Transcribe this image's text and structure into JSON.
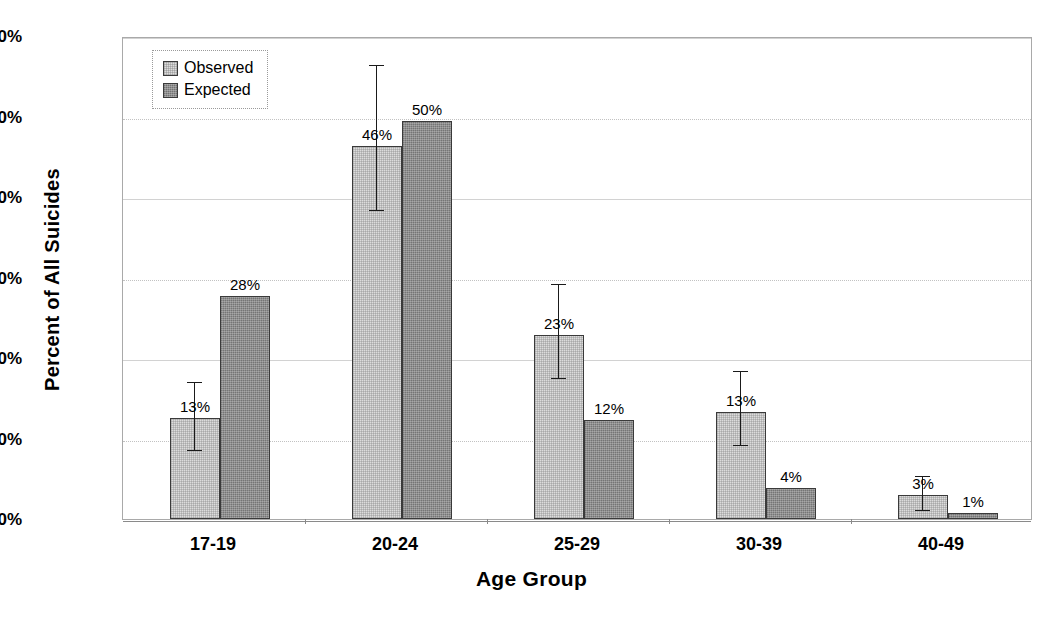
{
  "chart_data": {
    "type": "bar",
    "title": "",
    "xlabel": "Age Group",
    "ylabel": "Percent of All Suicides",
    "categories": [
      "17-19",
      "20-24",
      "25-29",
      "30-39",
      "40-49"
    ],
    "ylim": [
      0,
      60
    ],
    "ytick_labels": [
      "0%",
      "10%",
      "20%",
      "30%",
      "40%",
      "50%",
      "60%"
    ],
    "ytick_values": [
      0,
      10,
      20,
      30,
      40,
      50,
      60
    ],
    "grid": true,
    "legend_position": "top-left",
    "series": [
      {
        "name": "Observed",
        "color": "#dcdcdc",
        "values": [
          12.6,
          46.3,
          22.9,
          13.3,
          3.0
        ],
        "data_labels": [
          "13%",
          "46%",
          "23%",
          "13%",
          "3%"
        ],
        "error_bars": [
          {
            "low": 8.7,
            "high": 17.3
          },
          {
            "low": 38.5,
            "high": 56.6
          },
          {
            "low": 17.6,
            "high": 29.4
          },
          {
            "low": 9.3,
            "high": 18.6
          },
          {
            "low": 1.2,
            "high": 5.6
          }
        ]
      },
      {
        "name": "Expected",
        "color": "#8e8e8e",
        "values": [
          27.7,
          49.4,
          12.3,
          3.8,
          0.7
        ],
        "data_labels": [
          "28%",
          "50%",
          "12%",
          "4%",
          "1%"
        ],
        "error_bars": [
          null,
          null,
          null,
          null,
          null
        ]
      }
    ]
  },
  "legend": {
    "items": [
      {
        "label": "Observed"
      },
      {
        "label": "Expected"
      }
    ]
  }
}
